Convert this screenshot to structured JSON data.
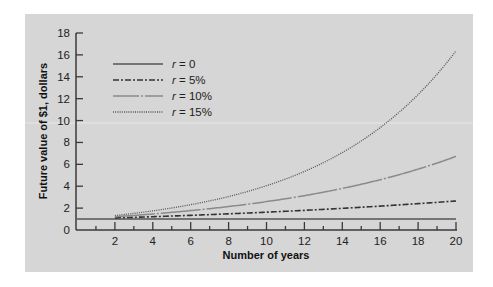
{
  "chart_data": {
    "type": "line",
    "title": "",
    "xlabel": "Number of years",
    "ylabel": "Future value of $1, dollars",
    "xlim": [
      0,
      20
    ],
    "ylim": [
      0,
      18
    ],
    "x_ticks": [
      2,
      4,
      6,
      8,
      10,
      12,
      14,
      16,
      18,
      20
    ],
    "y_ticks": [
      0,
      2,
      4,
      6,
      8,
      10,
      12,
      14,
      16,
      18
    ],
    "grid": false,
    "legend_position": "upper-left",
    "x": [
      0,
      1,
      2,
      3,
      4,
      5,
      6,
      7,
      8,
      9,
      10,
      11,
      12,
      13,
      14,
      15,
      16,
      17,
      18,
      19,
      20
    ],
    "series": [
      {
        "name": "r = 0",
        "rate_label": "0",
        "style": "solid",
        "color": "#555555",
        "values": [
          1,
          1,
          1,
          1,
          1,
          1,
          1,
          1,
          1,
          1,
          1,
          1,
          1,
          1,
          1,
          1,
          1,
          1,
          1,
          1,
          1
        ]
      },
      {
        "name": "r = 5%",
        "rate_label": "5%",
        "style": "dash-dot",
        "color": "#333333",
        "values": [
          1.0,
          1.05,
          1.1,
          1.16,
          1.22,
          1.28,
          1.34,
          1.41,
          1.48,
          1.55,
          1.63,
          1.71,
          1.8,
          1.89,
          1.98,
          2.08,
          2.18,
          2.29,
          2.41,
          2.53,
          2.65
        ]
      },
      {
        "name": "r = 10%",
        "rate_label": "10%",
        "style": "long-dash-dot",
        "color": "#8a8a8a",
        "values": [
          1.0,
          1.1,
          1.21,
          1.33,
          1.46,
          1.61,
          1.77,
          1.95,
          2.14,
          2.36,
          2.59,
          2.85,
          3.14,
          3.45,
          3.8,
          4.18,
          4.59,
          5.05,
          5.56,
          6.12,
          6.73
        ]
      },
      {
        "name": "r = 15%",
        "rate_label": "15%",
        "style": "dotted",
        "color": "#555555",
        "values": [
          1.0,
          1.15,
          1.32,
          1.52,
          1.75,
          2.01,
          2.31,
          2.66,
          3.06,
          3.52,
          4.05,
          4.65,
          5.35,
          6.15,
          7.08,
          8.14,
          9.36,
          10.76,
          12.38,
          14.23,
          16.37
        ]
      }
    ]
  },
  "legend": {
    "items": [
      {
        "var": "r",
        "eq": " = 0"
      },
      {
        "var": "r",
        "eq": " = 5%"
      },
      {
        "var": "r",
        "eq": " = 10%"
      },
      {
        "var": "r",
        "eq": " = 15%"
      }
    ]
  },
  "colors": {
    "panel": "#d6d6d6",
    "axis": "#3a3a3a",
    "background": "#ffffff"
  }
}
